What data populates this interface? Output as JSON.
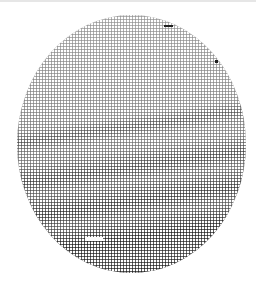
{
  "image": {
    "description": "Halftone dithered circular image of a banded planet-like disc (grayscale dot pattern)",
    "palette": {
      "background": "#ffffff",
      "dots": "#222222",
      "edge_line": "#e6e6e6"
    },
    "disc": {
      "left": 17,
      "top": 15,
      "width": 229,
      "height": 258
    },
    "dot_pitch_px": 3,
    "bands": "darker diagonal cloud bands increasing in density toward the bottom"
  }
}
